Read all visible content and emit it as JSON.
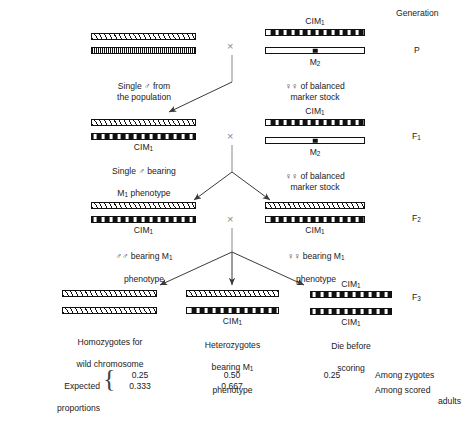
{
  "figure": {
    "generation_header": "Generation",
    "generations": [
      {
        "name": "P",
        "label": "P"
      },
      {
        "name": "F1",
        "label": "F",
        "sub": "1"
      },
      {
        "name": "F2",
        "label": "F",
        "sub": "2"
      },
      {
        "name": "F3",
        "label": "F",
        "sub": "3"
      }
    ],
    "chromosome_names": {
      "cim1": "CIM",
      "cim1_sub": "1",
      "m2": "M",
      "m2_sub": "2"
    },
    "rows": {
      "P": {
        "left": {
          "caption": "Single ♂ from\nthe population",
          "chromosomes": [
            "wild",
            "fine"
          ]
        },
        "right": {
          "caption": "♀♀ of balanced\nmarker stock",
          "top_label": "CIM",
          "top_label_sub": "1",
          "bottom_label": "M",
          "bottom_label_sub": "2",
          "chromosomes": [
            "cim",
            "m2"
          ]
        }
      },
      "F1": {
        "left": {
          "caption": "Single ♂ bearing\nM₁ phenotype",
          "caption_line1": "Single ♂ bearing",
          "caption_line2_pre": "M",
          "caption_line2_sub": "1",
          "caption_line2_post": " phenotype",
          "under_label": "CIM",
          "under_label_sub": "1",
          "chromosomes": [
            "wild",
            "cim"
          ]
        },
        "right": {
          "caption": "♀♀ of balanced\nmarker stock",
          "top_label": "CIM",
          "top_label_sub": "1",
          "bottom_label": "M",
          "bottom_label_sub": "2",
          "chromosomes": [
            "cim",
            "m2"
          ]
        }
      },
      "F2": {
        "left": {
          "caption_line1_pre": "♂♂ bearing M",
          "caption_line1_sub": "1",
          "caption_line2": "phenotype",
          "under_label": "CIM",
          "under_label_sub": "1",
          "chromosomes": [
            "wild",
            "cim"
          ]
        },
        "right": {
          "caption_line1_pre": "♀♀ bearing M",
          "caption_line1_sub": "1",
          "caption_line2": "phenotype",
          "under_label": "CIM",
          "under_label_sub": "1",
          "chromosomes": [
            "wild",
            "cim"
          ]
        }
      },
      "F3": {
        "left": {
          "caption_line1": "Homozygotes for",
          "caption_line2": "wild chromosome",
          "chromosomes": [
            "wild",
            "wild"
          ]
        },
        "middle": {
          "caption_line1": "Heterozygotes",
          "caption_line2_pre": "bearing M",
          "caption_line2_sub": "1",
          "caption_line3": "phenotype",
          "under_label": "CIM",
          "under_label_sub": "1",
          "chromosomes": [
            "wild",
            "cim"
          ]
        },
        "right": {
          "caption_line1": "Die before",
          "caption_line2": "scoring",
          "top_label": "CIM",
          "top_label_sub": "1",
          "under_label": "CIM",
          "under_label_sub": "1",
          "chromosomes": [
            "cim",
            "cim"
          ]
        }
      }
    },
    "proportions": {
      "row_label_line1": "Expected",
      "row_label_line2": "proportions",
      "brace": "{",
      "zygotes_note": "Among zygotes",
      "adults_note_line1": "Among scored",
      "adults_note_line2": "adults",
      "columns": [
        {
          "name": "left",
          "zygotes": "0.25",
          "adults": "0.333"
        },
        {
          "name": "middle",
          "zygotes": "0.50",
          "adults": "0.667"
        },
        {
          "name": "right",
          "zygotes": "0.25",
          "adults": ""
        }
      ]
    },
    "symbols": {
      "cross": "×",
      "male": "♂",
      "female": "♀"
    },
    "colors": {
      "ink": "#111111",
      "connector": "#8a8a8a",
      "background": "#ffffff"
    }
  }
}
